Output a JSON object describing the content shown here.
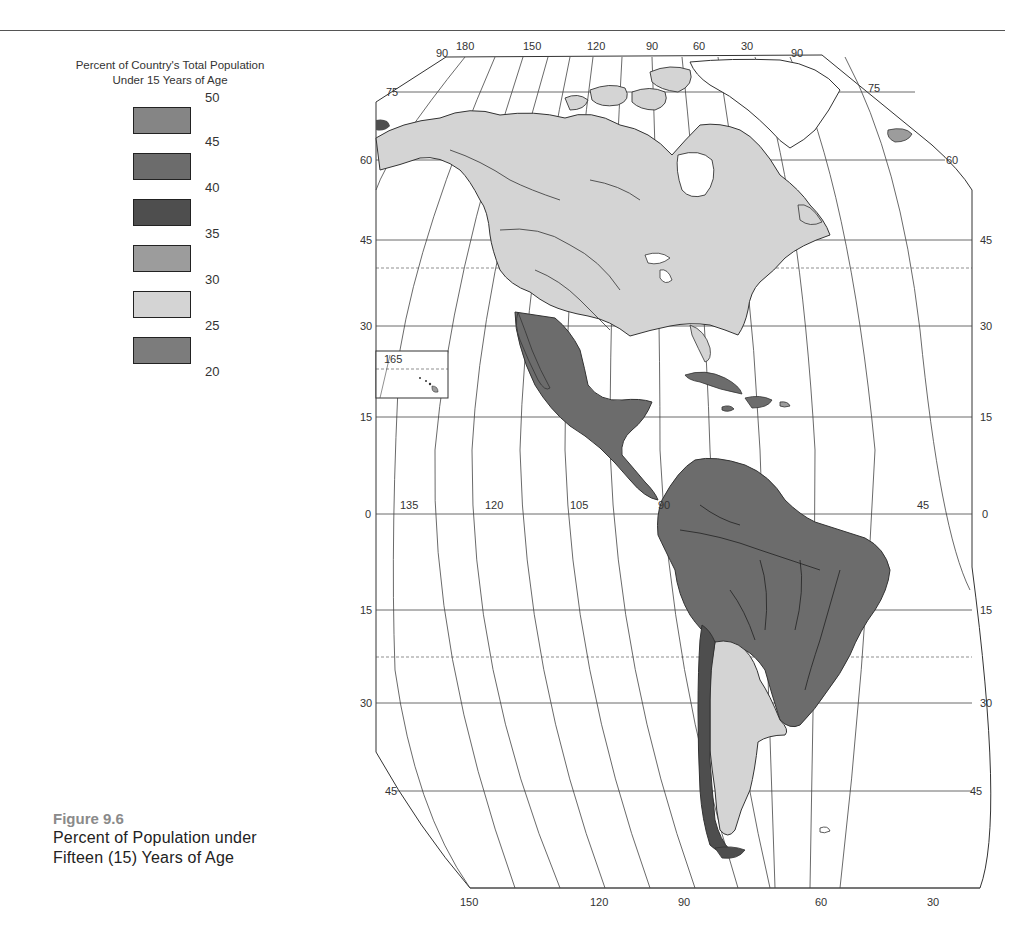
{
  "legend": {
    "title_line1": "Percent of Country's Total Population",
    "title_line2": "Under 15 Years of Age",
    "ticks": [
      "50",
      "45",
      "40",
      "35",
      "30",
      "25",
      "20"
    ],
    "classes": [
      {
        "range": "45-50",
        "color": "#858585"
      },
      {
        "range": "40-45",
        "color": "#6c6c6c"
      },
      {
        "range": "35-40",
        "color": "#4e4e4e"
      },
      {
        "range": "30-35",
        "color": "#9c9c9c"
      },
      {
        "range": "25-30",
        "color": "#d4d4d4"
      },
      {
        "range": "20-25",
        "color": "#7c7c7c"
      }
    ]
  },
  "caption": {
    "figure_number": "Figure 9.6",
    "line1": "Percent of Population under",
    "line2": "Fifteen (15) Years of Age"
  },
  "map": {
    "top_longitude_labels": [
      "90",
      "180",
      "150",
      "120",
      "90",
      "60",
      "30",
      "90"
    ],
    "bottom_longitude_labels": [
      "150",
      "120",
      "90",
      "60",
      "30"
    ],
    "equator_longitude_labels": [
      "135",
      "120",
      "105",
      "90",
      "45"
    ],
    "left_latitude_labels": [
      "75",
      "60",
      "45",
      "30",
      "15",
      "0",
      "15",
      "30",
      "45"
    ],
    "right_latitude_labels": [
      "75",
      "60",
      "45",
      "30",
      "15",
      "0",
      "15",
      "30",
      "45"
    ],
    "inset_label": "165",
    "regions": [
      {
        "name": "North America (USA/Canada)",
        "class": "25-30",
        "color": "#d4d4d4"
      },
      {
        "name": "Mexico & Central America",
        "class": "40-45",
        "color": "#6c6c6c"
      },
      {
        "name": "Caribbean (Cuba/Hispaniola)",
        "class": "40-45",
        "color": "#6c6c6c"
      },
      {
        "name": "Northern South America & Brazil",
        "class": "40-45",
        "color": "#6c6c6c"
      },
      {
        "name": "Chile",
        "class": "35-40",
        "color": "#4e4e4e"
      },
      {
        "name": "Argentina & Uruguay",
        "class": "25-30",
        "color": "#d4d4d4"
      },
      {
        "name": "Greenland",
        "class": "none",
        "color": "#ffffff"
      },
      {
        "name": "Iceland",
        "class": "20-25",
        "color": "#9c9c9c"
      }
    ]
  }
}
